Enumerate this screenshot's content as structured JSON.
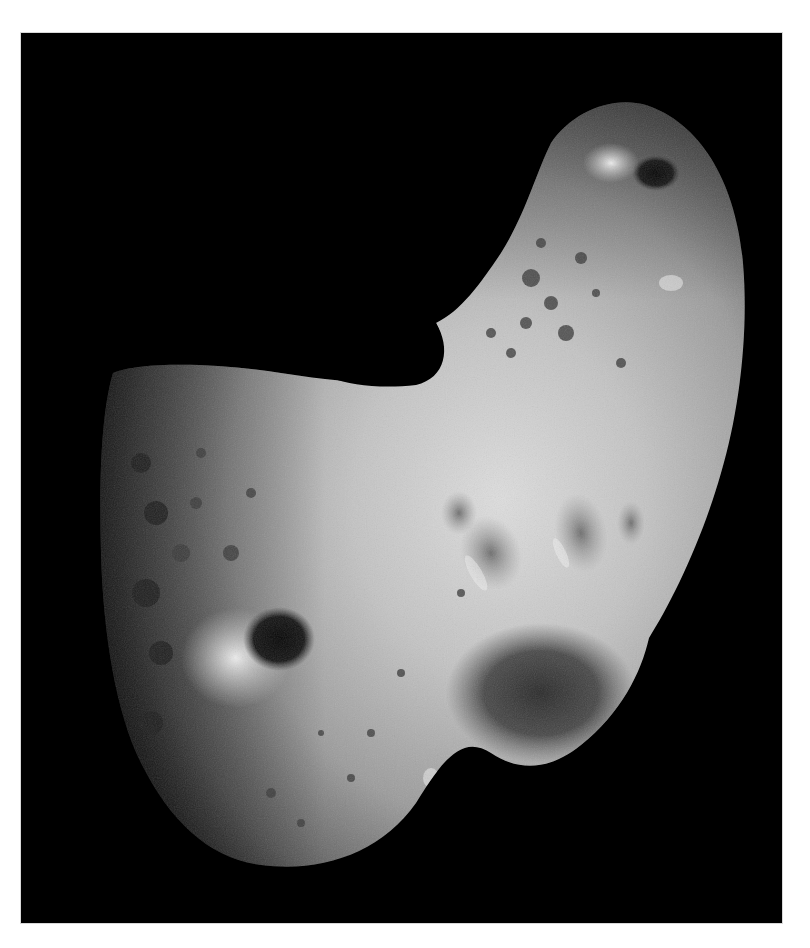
{
  "image": {
    "subject": "Asteroid surface photograph (elongated, peanut-shaped rocky body with craters) against black space",
    "alt": "Grayscale photograph of a cratered, elongated asteroid on a black background",
    "colors": {
      "page_background": "#ffffff",
      "space": "#000000",
      "surface_highlight": "#d9d9d9",
      "surface_mid": "#9a9a9a",
      "surface_shadow": "#3a3a3a"
    }
  }
}
